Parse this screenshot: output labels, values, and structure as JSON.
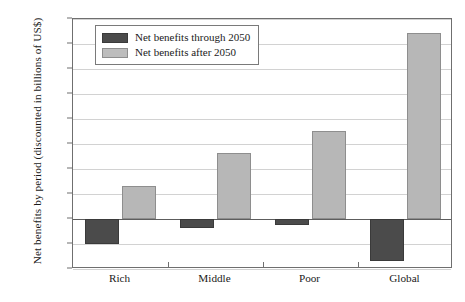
{
  "chart_data": {
    "type": "bar",
    "title": "",
    "xlabel": "",
    "ylabel": "Net benefits by period (discounted in billions of US$)",
    "categories": [
      "Rich",
      "Middle",
      "Poor",
      "Global"
    ],
    "series": [
      {
        "name": "Net benefits through 2050",
        "color": "#4b4b4b",
        "values": [
          -1000,
          -360,
          -230,
          -1680
        ]
      },
      {
        "name": "Net benefits after 2050",
        "color": "#b7b7b7",
        "values": [
          1320,
          2640,
          3520,
          7450
        ]
      }
    ],
    "ylim": [
      -2000,
      8000
    ],
    "ytick_step": 1000,
    "yticks": [
      {
        "value": 8000,
        "label": "8,000"
      },
      {
        "value": 7000,
        "label": "7,000"
      },
      {
        "value": 6000,
        "label": "6,000"
      },
      {
        "value": 5000,
        "label": "5,000"
      },
      {
        "value": 4000,
        "label": "4,000"
      },
      {
        "value": 3000,
        "label": "3,000"
      },
      {
        "value": 2000,
        "label": "2,000"
      },
      {
        "value": 1000,
        "label": "1,000"
      },
      {
        "value": 0,
        "label": "0"
      },
      {
        "value": -1000,
        "label": "-1,000"
      },
      {
        "value": -2000,
        "label": "-2,000"
      }
    ],
    "grid": true,
    "legend_position": "top-left-inside"
  },
  "legend": {
    "entries": [
      {
        "label": "Net benefits through 2050"
      },
      {
        "label": "Net benefits after 2050"
      }
    ]
  }
}
